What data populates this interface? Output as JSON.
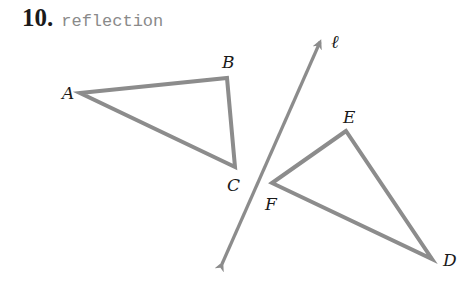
{
  "problem": {
    "number": "10.",
    "title": "reflection"
  },
  "figure": {
    "stroke_color": "#8c8c8c",
    "line_of_reflection": {
      "label": "ℓ",
      "start": [
        220,
        268
      ],
      "end": [
        322,
        38
      ]
    },
    "preimage_triangle": {
      "vertices": {
        "A": {
          "label": "A",
          "point": [
            80,
            93
          ]
        },
        "B": {
          "label": "B",
          "point": [
            227,
            78
          ]
        },
        "C": {
          "label": "C",
          "point": [
            235,
            167
          ]
        }
      }
    },
    "image_triangle": {
      "vertices": {
        "D": {
          "label": "D",
          "point": [
            432,
            259
          ]
        },
        "E": {
          "label": "E",
          "point": [
            346,
            131
          ]
        },
        "F": {
          "label": "F",
          "point": [
            272,
            183
          ]
        }
      }
    }
  }
}
